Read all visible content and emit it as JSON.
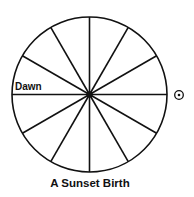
{
  "diagram": {
    "type": "astrological-house-wheel",
    "divisions": 12,
    "labels": {
      "left_horizon": "Dawn",
      "sun_symbol": "☉"
    },
    "sun_position": "right-horizon",
    "caption": "A Sunset Birth",
    "colors": {
      "stroke": "#111111",
      "background": "#ffffff"
    }
  }
}
